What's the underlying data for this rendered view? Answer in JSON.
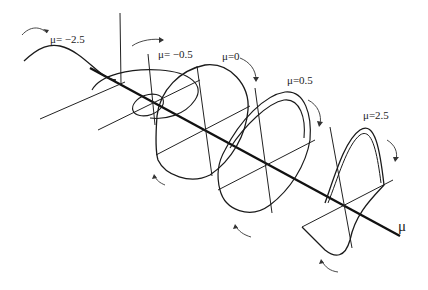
{
  "figure": {
    "type": "bifurcation phase portraits along parameter axis",
    "axis_label": "μ",
    "panel_axis_label": "y",
    "panels": [
      {
        "label": "μ= −2.5",
        "mu": -2.5
      },
      {
        "label": "μ= −0.5",
        "mu": -0.5
      },
      {
        "label": "μ=0",
        "mu": 0
      },
      {
        "label": "μ=0.5",
        "mu": 0.5
      },
      {
        "label": "μ=2.5",
        "mu": 2.5
      }
    ],
    "colors": {
      "curve": "#1a1a1a",
      "axis": "#111111",
      "tick_text": "#777777",
      "background": "#ffffff"
    }
  }
}
